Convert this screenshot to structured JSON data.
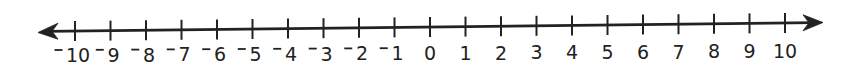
{
  "figure": {
    "type": "number-line",
    "min": -10,
    "max": 10,
    "step": 1,
    "line_color": "#222222",
    "arrows": {
      "left": true,
      "right": true
    },
    "negative_sign_style": "raised minus",
    "labels": [
      "−10",
      "−9",
      "−8",
      "−7",
      "−6",
      "−5",
      "−4",
      "−3",
      "−2",
      "−1",
      "0",
      "1",
      "2",
      "3",
      "4",
      "5",
      "6",
      "7",
      "8",
      "9",
      "10"
    ],
    "values": [
      -10,
      -9,
      -8,
      -7,
      -6,
      -5,
      -4,
      -3,
      -2,
      -1,
      0,
      1,
      2,
      3,
      4,
      5,
      6,
      7,
      8,
      9,
      10
    ]
  }
}
